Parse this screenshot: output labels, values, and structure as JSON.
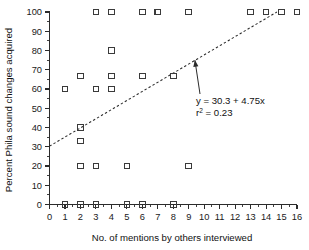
{
  "chart_data": {
    "type": "scatter",
    "title": "",
    "xlabel": "No. of mentions by others interviewed",
    "ylabel": "Percent Phila sound changes acquired",
    "xlim": [
      0,
      16
    ],
    "ylim": [
      0,
      100
    ],
    "grid": false,
    "legend": null,
    "x_ticks": [
      "0",
      "1",
      "2",
      "3",
      "4",
      "5",
      "6",
      "7",
      "8",
      "9",
      "10",
      "11",
      "12",
      "13",
      "14",
      "15",
      "16"
    ],
    "y_ticks": [
      "0",
      "10",
      "20",
      "30",
      "40",
      "50",
      "60",
      "70",
      "80",
      "90",
      "100"
    ],
    "x_tick_values": [
      0,
      1,
      2,
      3,
      4,
      5,
      6,
      7,
      8,
      9,
      10,
      11,
      12,
      13,
      14,
      15,
      16
    ],
    "y_tick_values": [
      0,
      10,
      20,
      30,
      40,
      50,
      60,
      70,
      80,
      90,
      100
    ],
    "marker": "open-square",
    "points": [
      {
        "x": 3,
        "y": 100
      },
      {
        "x": 4,
        "y": 100
      },
      {
        "x": 6,
        "y": 100
      },
      {
        "x": 7,
        "y": 100
      },
      {
        "x": 9,
        "y": 100
      },
      {
        "x": 13,
        "y": 100
      },
      {
        "x": 14,
        "y": 100
      },
      {
        "x": 15,
        "y": 100
      },
      {
        "x": 16,
        "y": 100
      },
      {
        "x": 4,
        "y": 80
      },
      {
        "x": 2,
        "y": 66.7
      },
      {
        "x": 4,
        "y": 66.7
      },
      {
        "x": 6,
        "y": 66.7
      },
      {
        "x": 8,
        "y": 66.7
      },
      {
        "x": 1,
        "y": 60
      },
      {
        "x": 3,
        "y": 60
      },
      {
        "x": 4,
        "y": 60
      },
      {
        "x": 2,
        "y": 40
      },
      {
        "x": 2,
        "y": 33
      },
      {
        "x": 2,
        "y": 20
      },
      {
        "x": 3,
        "y": 20
      },
      {
        "x": 5,
        "y": 20
      },
      {
        "x": 9,
        "y": 20
      },
      {
        "x": 1,
        "y": 0
      },
      {
        "x": 2,
        "y": 0
      },
      {
        "x": 3,
        "y": 0
      },
      {
        "x": 5,
        "y": 0
      },
      {
        "x": 6,
        "y": 0
      },
      {
        "x": 8,
        "y": 0
      }
    ],
    "fit_line": {
      "intercept": 30.3,
      "slope": 4.75,
      "style": "dashed",
      "x_start": 0,
      "x_end": 14.7
    },
    "annotation": {
      "equation": "y = 30.3 + 4.75x",
      "r_squared_label": "r",
      "r_squared_sup": "2",
      "r_squared_value": " = 0.23",
      "pointer_target_x": 9.4,
      "pointer_target_y": 75
    }
  },
  "colors": {
    "axis": "#2b2b2b",
    "marker_stroke": "#3a3a3a",
    "text": "#111111",
    "background": "#ffffff"
  }
}
